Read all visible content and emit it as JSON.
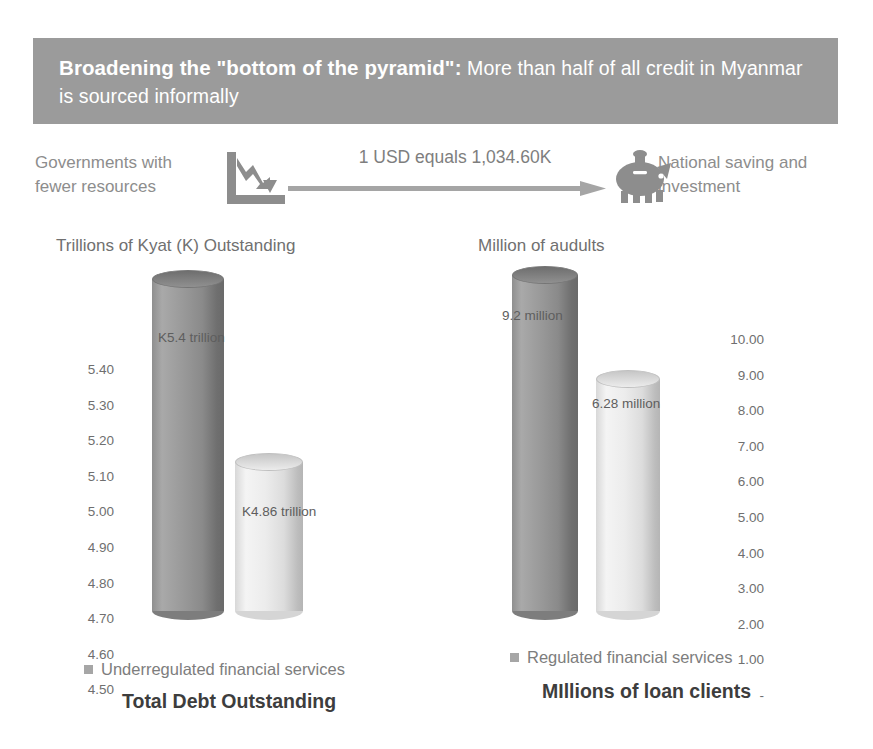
{
  "banner": {
    "lead": "Broadening the \"bottom of the pyramid\":",
    "rest": " More than half of all credit in Myanmar is sourced informally",
    "background_color": "#9b9b9b",
    "text_color": "#ffffff"
  },
  "flow": {
    "left_label": "Governments with fewer resources",
    "arrow_label": "1 USD equals 1,034.60K",
    "right_label": "National saving and investment",
    "left_icon": "declining-chart-icon",
    "right_icon": "piggy-bank-icon",
    "arrow_icon": "right-arrow-icon"
  },
  "charts": [
    {
      "id": "total-debt-outstanding",
      "subtitle": "Trillions of Kyat (K) Outstanding",
      "legend": "Underregulated financial services",
      "footer_title": "Total Debt Outstanding",
      "axis_ticks": [
        "5.40",
        "5.30",
        "5.20",
        "5.10",
        "5.00",
        "4.90",
        "4.80",
        "4.70",
        "4.60",
        "4.50"
      ],
      "bars": [
        {
          "label": "K5.4 trillion",
          "value": 5.4,
          "style": "dark"
        },
        {
          "label": "K4.86 trillion",
          "value": 4.86,
          "style": "light"
        }
      ]
    },
    {
      "id": "millions-of-loan-clients",
      "subtitle": "Million of audults",
      "legend": "Regulated financial services",
      "footer_title": "MIllions of loan clients",
      "axis_ticks": [
        "10.00",
        "9.00",
        "8.00",
        "7.00",
        "6.00",
        "5.00",
        "4.00",
        "3.00",
        "2.00",
        "1.00",
        "-"
      ],
      "bars": [
        {
          "label": "9.2 million",
          "value": 9.2,
          "style": "dark"
        },
        {
          "label": "6.28 million",
          "value": 6.28,
          "style": "light"
        }
      ]
    }
  ],
  "chart_data": [
    {
      "type": "bar",
      "title": "Total Debt Outstanding",
      "subtitle": "Trillions of Kyat (K) Outstanding",
      "categories": [
        "Underregulated financial services",
        "Regulated financial services"
      ],
      "values": [
        5.4,
        4.86
      ],
      "data_labels": [
        "K5.4 trillion",
        "K4.86 trillion"
      ],
      "ylabel": "Trillions of Kyat (K) Outstanding",
      "xlabel": "",
      "ylim": [
        4.5,
        5.45
      ],
      "ytick_labels": [
        "4.50",
        "4.60",
        "4.70",
        "4.80",
        "4.90",
        "5.00",
        "5.10",
        "5.20",
        "5.30",
        "5.40"
      ],
      "grid": false,
      "legend_position": "bottom",
      "series_colors": [
        "#8f8f8f",
        "#ececec"
      ]
    },
    {
      "type": "bar",
      "title": "MIllions of loan clients",
      "subtitle": "Million of audults",
      "categories": [
        "Underregulated financial services",
        "Regulated financial services"
      ],
      "values": [
        9.2,
        6.28
      ],
      "data_labels": [
        "9.2 million",
        "6.28 million"
      ],
      "ylabel": "Million of audults",
      "xlabel": "",
      "ylim": [
        0,
        10
      ],
      "ytick_labels": [
        "-",
        "1.00",
        "2.00",
        "3.00",
        "4.00",
        "5.00",
        "6.00",
        "7.00",
        "8.00",
        "9.00",
        "10.00"
      ],
      "grid": false,
      "legend_position": "bottom",
      "series_colors": [
        "#8f8f8f",
        "#ececec"
      ]
    }
  ]
}
